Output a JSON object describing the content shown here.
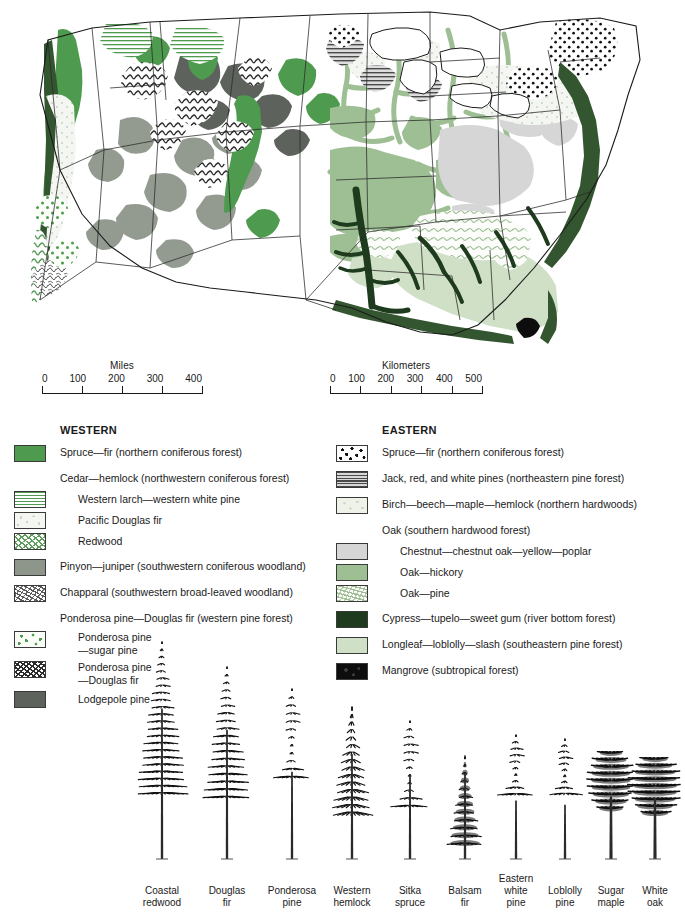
{
  "scales": {
    "miles": {
      "title": "Miles",
      "ticks": [
        "0",
        "100",
        "200",
        "300",
        "400"
      ]
    },
    "kilometers": {
      "title": "Kilometers",
      "ticks": [
        "0",
        "100",
        "200",
        "300",
        "400",
        "500"
      ]
    }
  },
  "legend": {
    "western": {
      "heading": "WESTERN",
      "entries": [
        {
          "label": "Spruce—fir (northern coniferous forest)",
          "swatch": "sw-solid-green",
          "indent": false,
          "hasSwatch": true,
          "spaced": false
        },
        {
          "label": "Cedar—hemlock (northwestern coniferous forest)",
          "swatch": "",
          "indent": false,
          "hasSwatch": false,
          "spaced": true
        },
        {
          "label": "Western larch—western white pine",
          "swatch": "sw-hlines-green",
          "indent": true,
          "hasSwatch": true,
          "spaced": false
        },
        {
          "label": "Pacific Douglas fir",
          "swatch": "sw-pale-mottle",
          "indent": true,
          "hasSwatch": true,
          "spaced": false
        },
        {
          "label": "Redwood",
          "swatch": "sw-redwood",
          "indent": true,
          "hasSwatch": true,
          "spaced": false
        },
        {
          "label": "Pinyon—juniper (southwestern coniferous woodland)",
          "swatch": "sw-gray-solid",
          "indent": false,
          "hasSwatch": true,
          "spaced": true
        },
        {
          "label": "Chapparal (southwestern broad-leaved woodland)",
          "swatch": "sw-chaparral",
          "indent": false,
          "hasSwatch": true,
          "spaced": true
        },
        {
          "label": "Ponderosa pine—Douglas fir (western pine forest)",
          "swatch": "",
          "indent": false,
          "hasSwatch": false,
          "spaced": true
        },
        {
          "label": "Ponderosa pine\n—sugar pine",
          "swatch": "sw-green-dots",
          "indent": true,
          "hasSwatch": true,
          "spaced": false
        },
        {
          "label": "Ponderosa pine\n—Douglas fir",
          "swatch": "sw-squiggle-dark",
          "indent": true,
          "hasSwatch": true,
          "spaced": false
        },
        {
          "label": "Lodgepole pine",
          "swatch": "sw-darkgray-solid",
          "indent": true,
          "hasSwatch": true,
          "spaced": false
        }
      ]
    },
    "eastern": {
      "heading": "EASTERN",
      "entries": [
        {
          "label": "Spruce—fir  (northern coniferous forest)",
          "swatch": "sw-black-dots",
          "indent": false,
          "hasSwatch": true,
          "spaced": false
        },
        {
          "label": "Jack, red, and white pines (northeastern pine forest)",
          "swatch": "sw-hlines-gray",
          "indent": false,
          "hasSwatch": true,
          "spaced": true
        },
        {
          "label": "Birch—beech—maple—hemlock (northern hardwoods)",
          "swatch": "sw-pale-green-mottle",
          "indent": false,
          "hasSwatch": true,
          "spaced": true
        },
        {
          "label": "Oak (southern hardwood forest)",
          "swatch": "",
          "indent": false,
          "hasSwatch": false,
          "spaced": true
        },
        {
          "label": "Chestnut—chestnut oak—yellow—poplar",
          "swatch": "sw-lightgray",
          "indent": true,
          "hasSwatch": true,
          "spaced": false
        },
        {
          "label": "Oak—hickory",
          "swatch": "sw-medgreen",
          "indent": true,
          "hasSwatch": true,
          "spaced": false
        },
        {
          "label": "Oak—pine",
          "swatch": "sw-oakpine",
          "indent": true,
          "hasSwatch": true,
          "spaced": false
        },
        {
          "label": "Cypress—tupelo—sweet gum (river bottom forest)",
          "swatch": "sw-verydark-green",
          "indent": false,
          "hasSwatch": true,
          "spaced": true
        },
        {
          "label": "Longleaf—loblolly—slash (southeastern pine forest)",
          "swatch": "sw-palegreen",
          "indent": false,
          "hasSwatch": true,
          "spaced": true
        },
        {
          "label": "Mangrove (subtropical forest)",
          "swatch": "sw-black-mottle",
          "indent": false,
          "hasSwatch": true,
          "spaced": true
        }
      ]
    }
  },
  "trees": [
    {
      "name": "Coastal\nredwood",
      "x": 162,
      "height": 215,
      "crown": 0.7,
      "width": 54,
      "shape": "spire"
    },
    {
      "name": "Douglas\nfir",
      "x": 227,
      "height": 190,
      "crown": 0.68,
      "width": 50,
      "shape": "spire"
    },
    {
      "name": "Ponderosa\npine",
      "x": 292,
      "height": 168,
      "crown": 0.52,
      "width": 46,
      "shape": "open"
    },
    {
      "name": "Western\nhemlock",
      "x": 352,
      "height": 150,
      "crown": 0.7,
      "width": 44,
      "shape": "droop"
    },
    {
      "name": "Sitka\nspruce",
      "x": 410,
      "height": 136,
      "crown": 0.62,
      "width": 48,
      "shape": "open"
    },
    {
      "name": "Balsam\nfir",
      "x": 465,
      "height": 100,
      "crown": 0.86,
      "width": 38,
      "shape": "cone"
    },
    {
      "name": "Eastern\nwhite\npine",
      "x": 516,
      "height": 122,
      "crown": 0.48,
      "width": 46,
      "shape": "open"
    },
    {
      "name": "Loblolly\npine",
      "x": 565,
      "height": 118,
      "crown": 0.46,
      "width": 44,
      "shape": "open"
    },
    {
      "name": "Sugar\nmaple",
      "x": 611,
      "height": 104,
      "crown": 0.6,
      "width": 48,
      "shape": "broad"
    },
    {
      "name": "White\noak",
      "x": 655,
      "height": 98,
      "crown": 0.62,
      "width": 54,
      "shape": "broad"
    }
  ],
  "colors": {
    "spruce_fir_west": "#4e9a4e",
    "pinyon_juniper": "#8e968c",
    "lodgepole": "#5d625c",
    "oak_hickory": "#9dbf93",
    "chestnut_oak": "#d6d6d6",
    "river_bottom": "#1e3b1e",
    "longleaf": "#cfe0c6",
    "northern_hardwoods": "#eef2e9",
    "mangrove": "#0d0d0d",
    "outline": "#1a1a1a"
  }
}
